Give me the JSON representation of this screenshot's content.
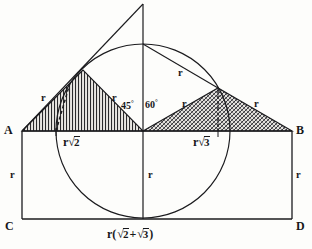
{
  "figure": {
    "background_color": "#fdfdfb",
    "ink_color": "#17171a",
    "points": {
      "A": "A",
      "B": "B",
      "C": "C",
      "D": "D"
    },
    "angles": {
      "left": "45",
      "left_unit": "°",
      "right": "60",
      "right_unit": "°"
    },
    "radius_labels": {
      "left_triangle_hyp": "r",
      "left_triangle_right_leg": "r",
      "right_triangle_left_leg": "r",
      "right_triangle_right_leg": "r",
      "circle_radius_chord": "r",
      "side_AC": "r",
      "center_vertical": "r",
      "side_BD": "r"
    },
    "base_labels": {
      "left_base": {
        "prefix": "r",
        "radical": "2"
      },
      "right_base": {
        "prefix": "r",
        "radical": "3"
      },
      "bottom_total_open": "r(",
      "bottom_total_rad1": "2",
      "bottom_total_plus": "+",
      "bottom_total_rad2": "3",
      "bottom_total_close": ")"
    },
    "hatching": {
      "left_triangle_style": "vertical-line-hatch",
      "right_triangle_style": "diagonal-cross-hatch"
    }
  }
}
